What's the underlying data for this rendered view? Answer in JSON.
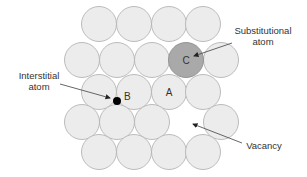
{
  "diagram": {
    "colors": {
      "atom_fill": "#ececec",
      "atom_stroke": "#b4b4b4",
      "substitutional_fill": "#a9a9a9",
      "interstitial_fill": "#000000",
      "text": "#333333"
    },
    "atoms": {
      "radius": 17.5,
      "rows": [
        {
          "y": 24,
          "x": [
            99,
            134,
            169,
            203
          ]
        },
        {
          "y": 60,
          "x": [
            82,
            117,
            152,
            221
          ]
        },
        {
          "y": 92,
          "x": [
            99,
            134,
            169,
            203
          ]
        },
        {
          "y": 122,
          "x": [
            82,
            117,
            152,
            221
          ]
        },
        {
          "y": 152,
          "x": [
            99,
            134,
            169,
            203
          ]
        }
      ]
    },
    "labels": {
      "A": "A",
      "B": "B",
      "C": "C",
      "substitutional_line1": "Substitutional",
      "substitutional_line2": "atom",
      "interstitial_line1": "Interstitial",
      "interstitial_line2": "atom",
      "vacancy": "Vacancy"
    },
    "defects": [
      {
        "type": "substitutional",
        "label": "C",
        "x": 186,
        "y": 60
      },
      {
        "type": "interstitial",
        "label": "B",
        "x": 117,
        "y": 101
      },
      {
        "type": "normal",
        "label": "A",
        "x": 169,
        "y": 92
      },
      {
        "type": "vacancy",
        "x": 186,
        "y": 122
      }
    ]
  }
}
